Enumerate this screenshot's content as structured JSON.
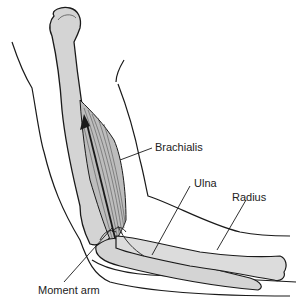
{
  "diagram": {
    "labels": {
      "brachialis": "Brachialis",
      "ulna": "Ulna",
      "radius": "Radius",
      "moment_arm": "Moment arm"
    },
    "colors": {
      "bone_fill": "#d4d4d4",
      "muscle_fill": "#bdbdbd",
      "outline": "#1a1a1a",
      "background": "#ffffff"
    }
  }
}
